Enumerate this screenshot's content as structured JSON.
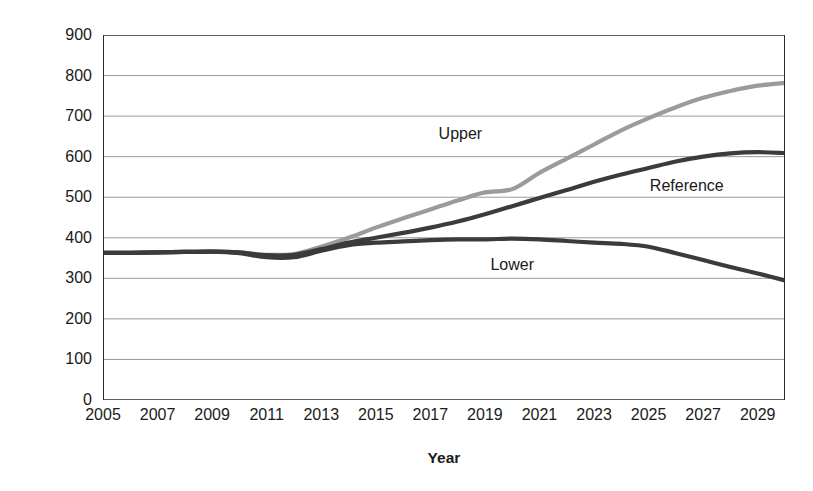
{
  "chart_data": {
    "type": "line",
    "title": "",
    "xlabel": "Year",
    "ylabel": "No. of nuclear power reactors",
    "xlim": [
      2005,
      2030
    ],
    "ylim": [
      0,
      900
    ],
    "grid": true,
    "legend_position": "inline-annotations",
    "y_ticks": [
      0,
      100,
      200,
      300,
      400,
      500,
      600,
      700,
      800,
      900
    ],
    "y_tick_labels": [
      "0",
      "100",
      "200",
      "300",
      "400",
      "500",
      "600",
      "700",
      "800",
      "900"
    ],
    "x_ticks": [
      2005,
      2006,
      2007,
      2008,
      2009,
      2010,
      2011,
      2012,
      2013,
      2014,
      2015,
      2016,
      2017,
      2018,
      2019,
      2020,
      2021,
      2022,
      2023,
      2024,
      2025,
      2026,
      2027,
      2028,
      2029,
      2030
    ],
    "x_tick_labels": [
      "2005",
      "",
      "2007",
      "",
      "2009",
      "",
      "2011",
      "",
      "2013",
      "",
      "2015",
      "",
      "2017",
      "",
      "2019",
      "",
      "2021",
      "",
      "2023",
      "",
      "2025",
      "",
      "2027",
      "",
      "2029",
      ""
    ],
    "x": [
      2005,
      2006,
      2007,
      2008,
      2009,
      2010,
      2011,
      2012,
      2013,
      2014,
      2015,
      2016,
      2017,
      2018,
      2019,
      2020,
      2021,
      2022,
      2023,
      2024,
      2025,
      2026,
      2027,
      2028,
      2029,
      2030
    ],
    "series": [
      {
        "name": "Upper",
        "color": "#9b9b9b",
        "values": [
          363,
          363,
          364,
          365,
          366,
          364,
          358,
          360,
          378,
          400,
          425,
          448,
          470,
          492,
          512,
          520,
          560,
          595,
          630,
          665,
          695,
          722,
          745,
          762,
          775,
          782
        ]
      },
      {
        "name": "Reference",
        "color": "#3b3b3b",
        "values": [
          363,
          363,
          364,
          365,
          366,
          364,
          357,
          358,
          372,
          388,
          400,
          412,
          425,
          440,
          458,
          478,
          498,
          518,
          538,
          556,
          572,
          588,
          600,
          608,
          611,
          609
        ]
      },
      {
        "name": "Lower",
        "color": "#3b3b3b",
        "values": [
          363,
          363,
          364,
          365,
          366,
          362,
          352,
          352,
          368,
          382,
          388,
          391,
          394,
          396,
          396,
          398,
          396,
          392,
          388,
          385,
          378,
          362,
          345,
          328,
          312,
          295
        ]
      }
    ],
    "annotations": [
      {
        "text": "Upper",
        "x": 2018.1,
        "y": 655
      },
      {
        "text": "Reference",
        "x": 2026.4,
        "y": 527
      },
      {
        "text": "Lower",
        "x": 2020.0,
        "y": 333
      }
    ]
  }
}
